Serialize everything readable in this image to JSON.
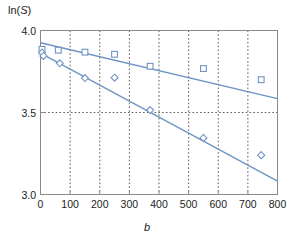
{
  "axes": {
    "ylabel_text": "ln(S)",
    "ylabel_prefix": "ln(",
    "ylabel_var": "S",
    "ylabel_suffix": ")",
    "xlabel_text": "b",
    "yticks": [
      "4.0",
      "3.5",
      "3.0"
    ],
    "xticks": [
      "0",
      "100",
      "200",
      "300",
      "400",
      "500",
      "600",
      "700",
      "800"
    ]
  },
  "colors": {
    "series": "#6e93c4",
    "line": "#6e93c4",
    "grid": "#4a4a4a",
    "frame": "#8a8a8a",
    "text": "#222222",
    "background": "#ffffff"
  },
  "chart_data": {
    "type": "scatter",
    "title": "",
    "xlabel": "b",
    "ylabel": "ln(S)",
    "xlim": [
      0,
      800
    ],
    "ylim": [
      3.0,
      4.0
    ],
    "xticks": [
      0,
      100,
      200,
      300,
      400,
      500,
      600,
      700,
      800
    ],
    "yticks": [
      3.0,
      3.5,
      4.0
    ],
    "grid": true,
    "grid_style": "dotted",
    "grid_x": [
      100,
      200,
      300,
      400,
      500,
      600,
      700
    ],
    "grid_y": [
      3.5
    ],
    "legend": "none",
    "series": [
      {
        "name": "squares",
        "marker": "open-square",
        "color": "#6e93c4",
        "points": [
          {
            "x": 5,
            "y": 3.885
          },
          {
            "x": 60,
            "y": 3.88
          },
          {
            "x": 150,
            "y": 3.868
          },
          {
            "x": 250,
            "y": 3.855
          },
          {
            "x": 370,
            "y": 3.782
          },
          {
            "x": 550,
            "y": 3.768
          },
          {
            "x": 745,
            "y": 3.7
          }
        ],
        "fit": {
          "type": "linear",
          "intercept": 3.925,
          "slope": -0.000425,
          "x0": 0,
          "y0": 3.925,
          "x1": 800,
          "y1": 3.585
        }
      },
      {
        "name": "diamonds",
        "marker": "open-diamond",
        "color": "#6e93c4",
        "points": [
          {
            "x": 5,
            "y": 3.865
          },
          {
            "x": 10,
            "y": 3.845
          },
          {
            "x": 65,
            "y": 3.8
          },
          {
            "x": 150,
            "y": 3.71
          },
          {
            "x": 250,
            "y": 3.712
          },
          {
            "x": 370,
            "y": 3.515
          },
          {
            "x": 550,
            "y": 3.345
          },
          {
            "x": 745,
            "y": 3.24
          }
        ],
        "fit": {
          "type": "linear",
          "intercept": 3.862,
          "slope": -0.000976,
          "x0": 0,
          "y0": 3.862,
          "x1": 800,
          "y1": 3.081
        }
      }
    ]
  }
}
